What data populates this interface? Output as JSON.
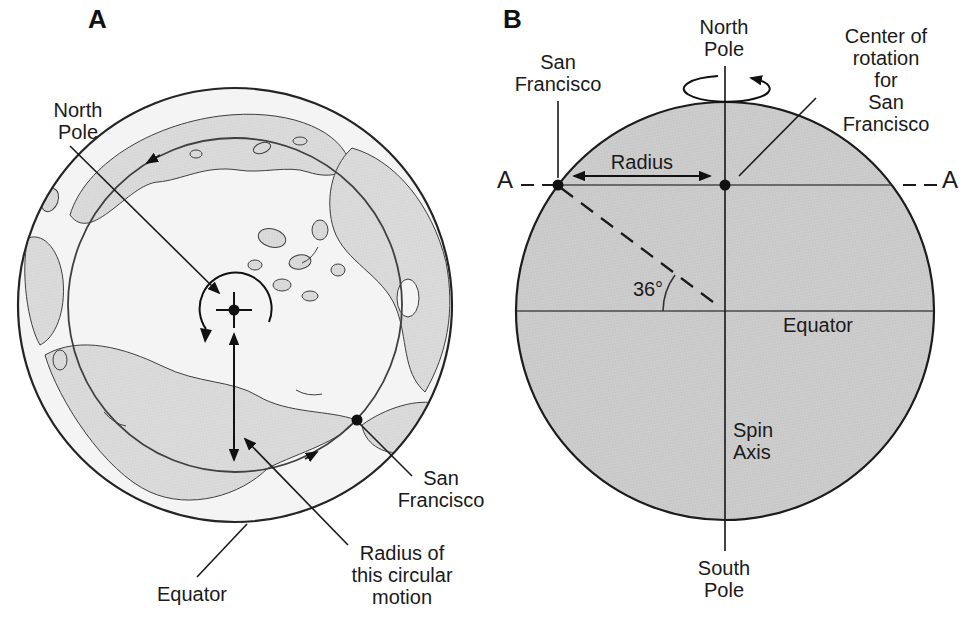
{
  "panelA": {
    "letter": "A",
    "labels": {
      "north_pole": "North\nPole",
      "equator": "Equator",
      "san_francisco": "San\nFrancisco",
      "radius_note": "Radius of\nthis circular\nmotion"
    }
  },
  "panelB": {
    "letter": "B",
    "labels": {
      "north_pole": "North\nPole",
      "south_pole": "South\nPole",
      "san_francisco": "San\nFrancisco",
      "center_of_rotation": "Center of\nrotation for\nSan Francisco",
      "radius": "Radius",
      "equator": "Equator",
      "spin_axis": "Spin\nAxis",
      "latitude_angle": "36°",
      "section_marker_left": "A",
      "section_marker_right": "A"
    }
  },
  "colors": {
    "background": "#ffffff",
    "ink": "#1a1a1a",
    "earth_side_fill": "#cecece",
    "land_fill": "#dcdcdc",
    "ocean_fill": "#f4f4f4",
    "thin_line": "#4a4a4a"
  }
}
